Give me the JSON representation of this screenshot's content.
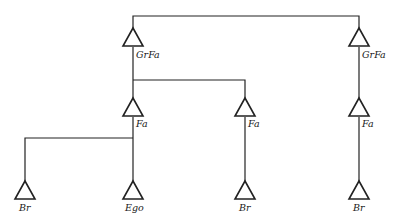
{
  "diagram": {
    "type": "kinship-chart",
    "nodes": [
      {
        "id": "grfa_left",
        "label": "GrFa",
        "symbol": "triangle",
        "x": 133,
        "y": 28
      },
      {
        "id": "grfa_right",
        "label": "GrFa",
        "symbol": "triangle",
        "x": 359,
        "y": 28
      },
      {
        "id": "fa_1",
        "label": "Fa",
        "symbol": "triangle",
        "x": 133,
        "y": 98
      },
      {
        "id": "fa_2",
        "label": "Fa",
        "symbol": "triangle",
        "x": 245,
        "y": 98
      },
      {
        "id": "fa_3",
        "label": "Fa",
        "symbol": "triangle",
        "x": 359,
        "y": 98
      },
      {
        "id": "br_1",
        "label": "Br",
        "symbol": "triangle",
        "x": 25,
        "y": 181
      },
      {
        "id": "ego",
        "label": "Ego",
        "symbol": "triangle",
        "x": 133,
        "y": 181
      },
      {
        "id": "br_2",
        "label": "Br",
        "symbol": "triangle",
        "x": 245,
        "y": 181
      },
      {
        "id": "br_3",
        "label": "Br",
        "symbol": "triangle",
        "x": 359,
        "y": 181
      }
    ],
    "edges": [
      {
        "from": "grfa_left",
        "to": "grfa_right",
        "kind": "sibling"
      },
      {
        "from": "grfa_left",
        "to": "fa_1",
        "kind": "descent"
      },
      {
        "from": "grfa_left",
        "to": "fa_2",
        "kind": "descent"
      },
      {
        "from": "grfa_right",
        "to": "fa_3",
        "kind": "descent"
      },
      {
        "from": "fa_1",
        "to": "br_1",
        "kind": "descent"
      },
      {
        "from": "fa_1",
        "to": "ego",
        "kind": "descent"
      },
      {
        "from": "fa_2",
        "to": "br_2",
        "kind": "descent"
      },
      {
        "from": "fa_3",
        "to": "br_3",
        "kind": "descent"
      }
    ],
    "labels": {
      "grfa_left": "GrFa",
      "grfa_right": "GrFa",
      "fa_1": "Fa",
      "fa_2": "Fa",
      "fa_3": "Fa",
      "br_1": "Br",
      "ego": "Ego",
      "br_2": "Br",
      "br_3": "Br"
    }
  }
}
